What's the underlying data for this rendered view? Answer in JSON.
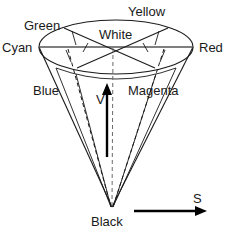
{
  "diagram": {
    "labels": {
      "yellow": "Yellow",
      "green": "Green",
      "white": "White",
      "cyan": "Cyan",
      "red": "Red",
      "blue": "Blue",
      "magenta": "Magenta",
      "black": "Black",
      "value_axis": "V",
      "saturation_axis": "S"
    },
    "colors": {
      "stroke": "#1a1a1a",
      "diameter_stroke": "#555555",
      "arrow": "#000000",
      "background": "#ffffff"
    },
    "geometry": {
      "ellipse_center_x": 116,
      "ellipse_center_y": 47,
      "ellipse_rx": 77,
      "ellipse_ry": 27,
      "apex_x": 112,
      "apex_y": 207
    },
    "elements": [
      "top-ellipse",
      "cone-left-edge",
      "cone-right-edge",
      "center-dashed-axis",
      "value-arrow",
      "saturation-arrow",
      "radial-spokes",
      "rim-ticks"
    ]
  }
}
